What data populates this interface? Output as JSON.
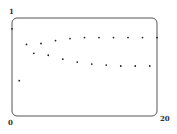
{
  "chart_data": {
    "type": "scatter",
    "title": "",
    "xlabel": "",
    "ylabel": "",
    "xlim": [
      0,
      20
    ],
    "ylim": [
      0,
      1
    ],
    "grid": false,
    "tick_labels": {
      "y_top": "1",
      "origin": "0",
      "x_right": "20"
    },
    "x": [
      0,
      1,
      2,
      3,
      4,
      5,
      6,
      7,
      8,
      9,
      10,
      11,
      12,
      13,
      14,
      15,
      16,
      17,
      18,
      19,
      20
    ],
    "y": [
      0.89,
      0.36,
      0.73,
      0.64,
      0.74,
      0.62,
      0.77,
      0.58,
      0.79,
      0.55,
      0.8,
      0.53,
      0.8,
      0.52,
      0.8,
      0.51,
      0.8,
      0.51,
      0.8,
      0.51,
      0.8
    ]
  }
}
